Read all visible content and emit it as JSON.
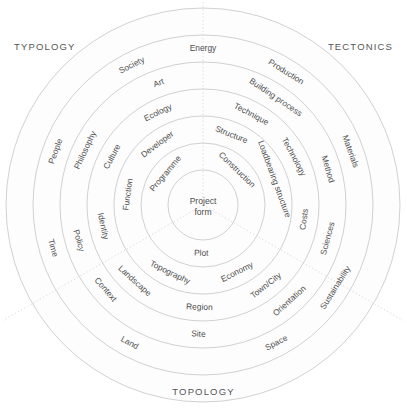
{
  "diagram": {
    "center": {
      "line1": "Project",
      "line2": "form"
    },
    "corners": {
      "typology": "TYPOLOGY",
      "tectonics": "TECTONICS",
      "topology": "TOPOLOGY"
    },
    "colors": {
      "ring_stroke": "#bdbdbd",
      "ring_fill": "#fdfdfd",
      "divider": "#cfcfcf",
      "text": "#4d4d4d",
      "corner_text": "#555555",
      "background": "#ffffff"
    },
    "geometry": {
      "cx": 203,
      "cy": 205,
      "ring_radii": [
        35,
        62,
        89,
        116,
        143,
        170,
        197
      ],
      "sector_boundary_angles_deg": [
        90,
        210,
        330
      ]
    },
    "sectors": [
      {
        "name": "typology",
        "label": "TYPOLOGY",
        "rings": [
          [
            "Programme"
          ],
          [
            "Developer",
            "Function"
          ],
          [
            "Ecology",
            "Culture",
            "Identity"
          ],
          [
            "Art",
            "Philosophy",
            "Policy"
          ],
          [
            "Society",
            "People",
            "Time"
          ]
        ]
      },
      {
        "name": "tectonics",
        "label": "TECTONICS",
        "rings": [
          [
            "Construction"
          ],
          [
            "Structure",
            "Loadbearing structure"
          ],
          [
            "Technique",
            "Technology",
            "Costs"
          ],
          [
            "Building process",
            "Method",
            "Sciences"
          ],
          [
            "Energy",
            "Production",
            "Materials"
          ]
        ]
      },
      {
        "name": "topology",
        "label": "TOPOLOGY",
        "rings": [
          [
            "Plot"
          ],
          [
            "Topography",
            "Economy"
          ],
          [
            "Region",
            "Landscape",
            "Town/City"
          ],
          [
            "Site",
            "Context",
            "Orientation"
          ],
          [
            "Land",
            "Space",
            "Sustainability"
          ]
        ]
      }
    ],
    "labels": [
      {
        "text": "Project",
        "ring": 0,
        "kind": "center"
      },
      {
        "text": "form",
        "ring": 0,
        "kind": "center"
      },
      {
        "text": "Programme",
        "ring": 1,
        "angle": 140,
        "size": 8.4,
        "sector": "typology"
      },
      {
        "text": "Construction",
        "ring": 1,
        "angle": 46,
        "size": 8.4,
        "sector": "tectonics"
      },
      {
        "text": "Plot",
        "ring": 1,
        "angle": 268,
        "size": 8.4,
        "sector": "topology"
      },
      {
        "text": "Developer",
        "ring": 2,
        "angle": 127,
        "size": 8.4,
        "sector": "typology"
      },
      {
        "text": "Function",
        "ring": 2,
        "angle": 172,
        "size": 8.4,
        "sector": "typology"
      },
      {
        "text": "Structure",
        "ring": 2,
        "angle": 68,
        "size": 8.4,
        "sector": "tectonics"
      },
      {
        "text": "Loadbearing structure",
        "ring": 2,
        "angle": 20,
        "size": 8.4,
        "sector": "tectonics"
      },
      {
        "text": "Topography",
        "ring": 2,
        "angle": 244,
        "size": 8.4,
        "sector": "topology"
      },
      {
        "text": "Economy",
        "ring": 2,
        "angle": 297,
        "size": 8.4,
        "sector": "topology"
      },
      {
        "text": "Ecology",
        "ring": 3,
        "angle": 116,
        "size": 8.4,
        "sector": "typology"
      },
      {
        "text": "Culture",
        "ring": 3,
        "angle": 152,
        "size": 8.4,
        "sector": "typology"
      },
      {
        "text": "Identity",
        "ring": 3,
        "angle": 192,
        "size": 8.4,
        "sector": "typology"
      },
      {
        "text": "Technique",
        "ring": 3,
        "angle": 62,
        "size": 8.4,
        "sector": "tectonics"
      },
      {
        "text": "Technology",
        "ring": 3,
        "angle": 28,
        "size": 8.4,
        "sector": "tectonics"
      },
      {
        "text": "Costs",
        "ring": 3,
        "angle": 352,
        "size": 8.4,
        "sector": "tectonics"
      },
      {
        "text": "Region",
        "ring": 3,
        "angle": 268,
        "size": 8.4,
        "sector": "topology"
      },
      {
        "text": "Landscape",
        "ring": 3,
        "angle": 228,
        "size": 8.4,
        "sector": "topology"
      },
      {
        "text": "Town/City",
        "ring": 3,
        "angle": 308,
        "size": 8.4,
        "sector": "topology"
      },
      {
        "text": "Art",
        "ring": 4,
        "angle": 110,
        "size": 8.4,
        "sector": "typology"
      },
      {
        "text": "Philosophy",
        "ring": 4,
        "angle": 155,
        "size": 8.4,
        "sector": "typology"
      },
      {
        "text": "Policy",
        "ring": 4,
        "angle": 196,
        "size": 8.4,
        "sector": "typology"
      },
      {
        "text": "Building process",
        "ring": 4,
        "angle": 56,
        "size": 8.4,
        "sector": "tectonics"
      },
      {
        "text": "Method",
        "ring": 4,
        "angle": 16,
        "size": 8.4,
        "sector": "tectonics"
      },
      {
        "text": "Sciences",
        "ring": 4,
        "angle": 345,
        "size": 8.4,
        "sector": "tectonics"
      },
      {
        "text": "Site",
        "ring": 4,
        "angle": 268,
        "size": 8.4,
        "sector": "topology"
      },
      {
        "text": "Context",
        "ring": 4,
        "angle": 221,
        "size": 8.4,
        "sector": "topology"
      },
      {
        "text": "Orientation",
        "ring": 4,
        "angle": 312,
        "size": 8.4,
        "sector": "topology"
      },
      {
        "text": "Society",
        "ring": 5,
        "angle": 117,
        "size": 8.4,
        "sector": "typology"
      },
      {
        "text": "People",
        "ring": 5,
        "angle": 160,
        "size": 8.4,
        "sector": "typology"
      },
      {
        "text": "Time",
        "ring": 5,
        "angle": 196,
        "size": 8.4,
        "sector": "typology"
      },
      {
        "text": "Energy",
        "ring": 5,
        "angle": 90,
        "size": 8.4,
        "sector": "tectonics"
      },
      {
        "text": "Production",
        "ring": 5,
        "angle": 58,
        "size": 8.4,
        "sector": "tectonics"
      },
      {
        "text": "Materials",
        "ring": 5,
        "angle": 20,
        "size": 8.4,
        "sector": "tectonics"
      },
      {
        "text": "Land",
        "ring": 5,
        "angle": 242,
        "size": 8.4,
        "sector": "topology"
      },
      {
        "text": "Space",
        "ring": 5,
        "angle": 298,
        "size": 8.4,
        "sector": "topology"
      },
      {
        "text": "Sustainability",
        "ring": 5,
        "angle": 328,
        "size": 8.4,
        "sector": "topology"
      }
    ]
  }
}
